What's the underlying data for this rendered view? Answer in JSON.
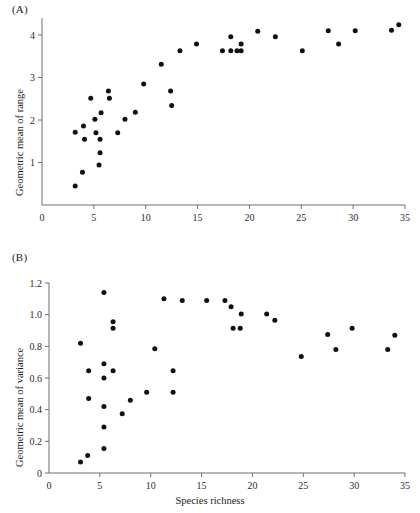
{
  "figure": {
    "panel_a_label": "(A)",
    "panel_b_label": "(B)",
    "shared_xlabel": "Species richness"
  },
  "chart_data": [
    {
      "type": "scatter",
      "panel": "(A)",
      "title": "",
      "xlabel": "Species richness",
      "ylabel": "Geometric mean of range",
      "xlim": [
        0,
        35
      ],
      "ylim": [
        0,
        4.4
      ],
      "xticks": [
        0,
        5,
        10,
        15,
        20,
        25,
        30,
        35
      ],
      "xticklabels": [
        "0",
        "5",
        "10",
        "15",
        "20",
        "25",
        "30",
        "35"
      ],
      "yticks": [
        1,
        2,
        3,
        4
      ],
      "yticklabels": [
        "1",
        "2",
        "3",
        "4"
      ],
      "grid": false,
      "legend": "none",
      "marker": "filled-circle",
      "marker_color": "#111111",
      "points": [
        [
          3.2,
          0.45
        ],
        [
          3.2,
          1.71
        ],
        [
          3.9,
          0.77
        ],
        [
          4.0,
          1.86
        ],
        [
          4.1,
          1.55
        ],
        [
          4.7,
          2.51
        ],
        [
          5.1,
          2.02
        ],
        [
          5.2,
          1.7
        ],
        [
          5.5,
          0.94
        ],
        [
          5.6,
          1.23
        ],
        [
          5.6,
          1.55
        ],
        [
          5.7,
          2.17
        ],
        [
          6.4,
          2.68
        ],
        [
          6.5,
          2.51
        ],
        [
          7.3,
          1.7
        ],
        [
          8.0,
          2.02
        ],
        [
          9.0,
          2.18
        ],
        [
          9.8,
          2.85
        ],
        [
          11.5,
          3.31
        ],
        [
          12.4,
          2.68
        ],
        [
          12.5,
          2.34
        ],
        [
          13.3,
          3.63
        ],
        [
          14.9,
          3.79
        ],
        [
          17.4,
          3.63
        ],
        [
          18.2,
          3.96
        ],
        [
          18.2,
          3.63
        ],
        [
          18.8,
          3.63
        ],
        [
          19.2,
          3.79
        ],
        [
          19.2,
          3.63
        ],
        [
          20.8,
          4.09
        ],
        [
          22.5,
          3.96
        ],
        [
          25.1,
          3.63
        ],
        [
          27.6,
          4.1
        ],
        [
          28.6,
          3.79
        ],
        [
          30.2,
          4.1
        ],
        [
          33.7,
          4.11
        ],
        [
          34.4,
          4.24
        ]
      ]
    },
    {
      "type": "scatter",
      "panel": "(B)",
      "title": "",
      "xlabel": "Species richness",
      "ylabel": "Geometric mean of variance",
      "xlim": [
        0,
        35
      ],
      "ylim": [
        0,
        1.2
      ],
      "xticks": [
        0,
        5,
        10,
        15,
        20,
        25,
        30,
        35
      ],
      "xticklabels": [
        "0",
        "5",
        "10",
        "15",
        "20",
        "25",
        "30",
        "35"
      ],
      "yticks": [
        0,
        0.2,
        0.4,
        0.6,
        0.8,
        1.0,
        1.2
      ],
      "yticklabels": [
        "0",
        "0.2",
        "0.4",
        "0.6",
        "0.8",
        "1.0",
        "1.2"
      ],
      "grid": false,
      "legend": "none",
      "marker": "filled-circle",
      "marker_color": "#111111",
      "points": [
        [
          3.1,
          0.07
        ],
        [
          3.1,
          0.82
        ],
        [
          3.8,
          0.11
        ],
        [
          3.9,
          0.47
        ],
        [
          3.9,
          0.645
        ],
        [
          5.4,
          0.155
        ],
        [
          5.4,
          0.29
        ],
        [
          5.4,
          0.42
        ],
        [
          5.4,
          0.6
        ],
        [
          5.4,
          0.69
        ],
        [
          5.4,
          1.14
        ],
        [
          6.3,
          0.645
        ],
        [
          6.3,
          0.915
        ],
        [
          6.3,
          0.955
        ],
        [
          7.2,
          0.375
        ],
        [
          8.0,
          0.46
        ],
        [
          9.6,
          0.51
        ],
        [
          10.4,
          0.785
        ],
        [
          11.3,
          1.1
        ],
        [
          12.2,
          0.51
        ],
        [
          12.2,
          0.645
        ],
        [
          13.1,
          1.09
        ],
        [
          15.5,
          1.09
        ],
        [
          17.3,
          1.09
        ],
        [
          17.9,
          1.05
        ],
        [
          18.1,
          0.915
        ],
        [
          18.8,
          0.915
        ],
        [
          18.9,
          1.005
        ],
        [
          21.4,
          1.005
        ],
        [
          22.2,
          0.965
        ],
        [
          24.8,
          0.735
        ],
        [
          27.4,
          0.875
        ],
        [
          28.2,
          0.78
        ],
        [
          29.8,
          0.915
        ],
        [
          33.3,
          0.78
        ],
        [
          34.0,
          0.87
        ]
      ]
    }
  ]
}
